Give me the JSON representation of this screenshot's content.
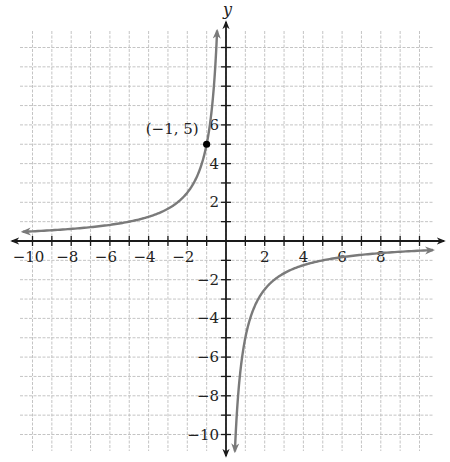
{
  "chart_data": {
    "type": "line",
    "title": "",
    "xlabel": "",
    "ylabel": "y",
    "xlim": [
      -10.5,
      10.5
    ],
    "ylim": [
      -10.5,
      10.5
    ],
    "grid": true,
    "x_ticks": [
      -10,
      -8,
      -6,
      -4,
      -2,
      2,
      4,
      6,
      8
    ],
    "y_ticks": [
      -10,
      -8,
      -6,
      -4,
      -2,
      2,
      4,
      6
    ],
    "x_tick_labels": [
      "−10",
      "−8",
      "−6",
      "−4",
      "−2",
      "2",
      "4",
      "6",
      "8"
    ],
    "y_tick_labels": [
      "−10",
      "−8",
      "−6",
      "−4",
      "−2",
      "2",
      "4",
      "6"
    ],
    "function": "y = -5/x",
    "vertical_asymptote": 0,
    "horizontal_asymptote": 0,
    "series": [
      {
        "name": "left branch",
        "x": [
          -10.5,
          -10,
          -8,
          -6,
          -5,
          -4,
          -3,
          -2,
          -1.5,
          -1,
          -0.8,
          -0.6,
          -0.5,
          -0.46
        ],
        "y": [
          0.48,
          0.5,
          0.625,
          0.83,
          1,
          1.25,
          1.67,
          2.5,
          3.33,
          5,
          6.25,
          8.33,
          10,
          10.8
        ],
        "color": "#7a7a7a"
      },
      {
        "name": "right branch",
        "x": [
          0.46,
          0.5,
          0.6,
          0.8,
          1,
          1.5,
          2,
          3,
          4,
          5,
          6,
          8,
          10,
          10.7
        ],
        "y": [
          -10.8,
          -10,
          -8.33,
          -6.25,
          -5,
          -3.33,
          -2.5,
          -1.67,
          -1.25,
          -1,
          -0.83,
          -0.625,
          -0.5,
          -0.47
        ],
        "color": "#7a7a7a"
      }
    ],
    "annotations": [
      {
        "text": "(−1, 5)",
        "point": [
          -1,
          5
        ]
      }
    ]
  },
  "colors": {
    "axis": "#1a1a1a",
    "curve": "#7a7a7a",
    "grid": "#bdbdbd",
    "point": "#000000"
  }
}
